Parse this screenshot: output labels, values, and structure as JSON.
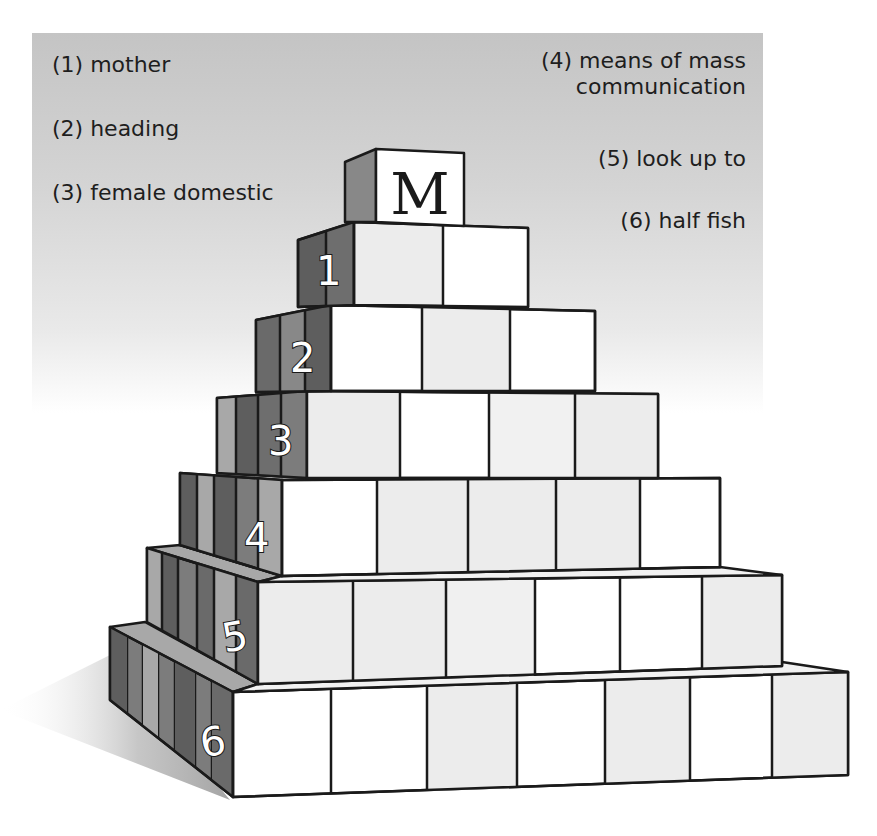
{
  "puzzle": {
    "top_letter": "M",
    "clues": [
      {
        "num": "1",
        "text": "(1) mother"
      },
      {
        "num": "2",
        "text": "(2) heading"
      },
      {
        "num": "3",
        "text": "(3) female domestic"
      },
      {
        "num": "4",
        "text_line1": "(4) means of mass",
        "text_line2": "communication"
      },
      {
        "num": "5",
        "text": "(5) look up to"
      },
      {
        "num": "6",
        "text": "(6) half fish"
      }
    ],
    "rows": [
      {
        "label": "1",
        "blocks": 2
      },
      {
        "label": "2",
        "blocks": 3
      },
      {
        "label": "3",
        "blocks": 4
      },
      {
        "label": "4",
        "blocks": 5
      },
      {
        "label": "5",
        "blocks": 6
      },
      {
        "label": "6",
        "blocks": 7
      }
    ]
  },
  "colors": {
    "panel_gray": "#c4c4c4",
    "block_face_white": "#ffffff",
    "block_face_light": "#ececec",
    "side_dark": "#5e5e5e",
    "side_mid": "#7c7c7c",
    "side_light": "#a8a8a8",
    "outline": "#1a1a1a"
  }
}
